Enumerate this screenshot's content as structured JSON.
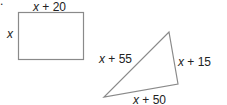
{
  "figure": {
    "marker": ".",
    "rectangle": {
      "top_label_var": "x",
      "top_label_rest": " + 20",
      "left_label": "x"
    },
    "triangle": {
      "left_label_var": "x",
      "left_label_rest": " + 55",
      "right_label_var": "x",
      "right_label_rest": " + 15",
      "bottom_label_var": "x",
      "bottom_label_rest": " + 50"
    },
    "stroke_color": "#8a8a8a"
  }
}
